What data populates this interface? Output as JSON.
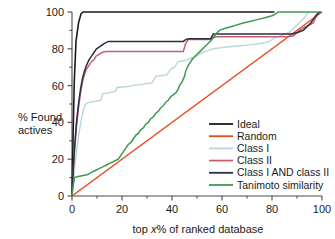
{
  "chart_data": {
    "type": "line",
    "title": "",
    "xlabel": "top x% of ranked database",
    "xlabel_prefix": "top ",
    "xlabel_italic": "x",
    "xlabel_suffix": "% of ranked database",
    "ylabel": "% Found actives",
    "ylabel_line1": "% Found",
    "ylabel_line2": "actives",
    "xlim": [
      0,
      100
    ],
    "ylim": [
      0,
      100
    ],
    "xticks": [
      0,
      20,
      40,
      60,
      80,
      100
    ],
    "yticks": [
      0,
      20,
      40,
      60,
      80,
      100
    ],
    "xtick_labels": [
      "0",
      "20",
      "40",
      "60",
      "80",
      "100"
    ],
    "ytick_labels": [
      "0",
      "20",
      "40",
      "60",
      "80",
      "100"
    ],
    "xminor_ticks": [
      10,
      30,
      50,
      70,
      90
    ],
    "yminor_ticks": [
      10,
      30,
      50,
      70,
      90
    ],
    "grid": false,
    "legend_position": "lower right",
    "series": [
      {
        "name": "Ideal",
        "color": "#1b1b1b",
        "width": 1.6,
        "points": [
          [
            0,
            0
          ],
          [
            0.4,
            30
          ],
          [
            0.9,
            62
          ],
          [
            1.6,
            84
          ],
          [
            2.6,
            94
          ],
          [
            3.6,
            99
          ],
          [
            4.4,
            100
          ],
          [
            81,
            100
          ]
        ]
      },
      {
        "name": "Random",
        "color": "#e8491d",
        "width": 1.5,
        "points": [
          [
            0,
            0
          ],
          [
            100,
            100
          ]
        ]
      },
      {
        "name": "Class I",
        "color": "#b9d6dc",
        "width": 1.4,
        "points": [
          [
            0,
            0
          ],
          [
            0.6,
            8
          ],
          [
            1.3,
            18
          ],
          [
            2.2,
            28
          ],
          [
            3.0,
            36
          ],
          [
            3.8,
            42
          ],
          [
            4.6,
            47
          ],
          [
            5.6,
            50
          ],
          [
            7.0,
            51
          ],
          [
            9.5,
            51.5
          ],
          [
            11.5,
            52
          ],
          [
            12.3,
            55.5
          ],
          [
            14.5,
            56
          ],
          [
            17.5,
            57
          ],
          [
            18.0,
            59
          ],
          [
            22.5,
            59.5
          ],
          [
            24.0,
            60
          ],
          [
            27.0,
            60.5
          ],
          [
            29.5,
            61
          ],
          [
            32.0,
            61.5
          ],
          [
            33.5,
            65
          ],
          [
            36.5,
            65.5
          ],
          [
            38.0,
            66
          ],
          [
            39.5,
            69
          ],
          [
            41.0,
            70
          ],
          [
            42.5,
            73
          ],
          [
            44.5,
            73.5
          ],
          [
            46.0,
            74
          ],
          [
            48.0,
            75
          ],
          [
            50.0,
            76
          ],
          [
            52.0,
            78
          ],
          [
            54.5,
            79
          ],
          [
            56.5,
            80
          ],
          [
            59.0,
            80.5
          ],
          [
            62.0,
            81
          ],
          [
            66.0,
            81.5
          ],
          [
            70.0,
            82
          ],
          [
            73.0,
            82.5
          ],
          [
            76.0,
            83
          ],
          [
            79.0,
            84
          ],
          [
            81.0,
            86
          ],
          [
            83.5,
            87
          ],
          [
            85.5,
            88
          ],
          [
            87.0,
            89
          ],
          [
            88.5,
            91
          ],
          [
            90.0,
            93
          ],
          [
            91.5,
            95
          ],
          [
            93.0,
            97
          ],
          [
            94.0,
            99
          ],
          [
            94.6,
            100
          ]
        ]
      },
      {
        "name": "Class II",
        "color": "#c4606a",
        "width": 1.5,
        "points": [
          [
            0,
            0
          ],
          [
            0.5,
            14
          ],
          [
            1.1,
            26
          ],
          [
            1.8,
            38
          ],
          [
            2.6,
            48
          ],
          [
            3.4,
            56
          ],
          [
            4.2,
            62
          ],
          [
            5.0,
            66
          ],
          [
            5.8,
            69
          ],
          [
            6.8,
            71
          ],
          [
            7.8,
            73
          ],
          [
            8.8,
            74
          ],
          [
            9.6,
            76
          ],
          [
            10.8,
            77
          ],
          [
            12.0,
            78
          ],
          [
            13.6,
            78.5
          ],
          [
            44.5,
            78.5
          ],
          [
            45.5,
            83
          ],
          [
            46.5,
            85
          ],
          [
            55.5,
            85
          ],
          [
            56.5,
            86
          ],
          [
            57.5,
            86.5
          ],
          [
            86.0,
            86.5
          ],
          [
            88.5,
            87
          ],
          [
            91.0,
            90
          ],
          [
            93.5,
            92
          ],
          [
            95.0,
            93
          ],
          [
            96.5,
            94
          ],
          [
            97.5,
            97
          ],
          [
            98.5,
            99
          ],
          [
            99.3,
            100
          ]
        ]
      },
      {
        "name": "Class I AND class II",
        "color": "#2d2d4a",
        "width": 1.5,
        "points": [
          [
            0,
            0
          ],
          [
            0.5,
            15
          ],
          [
            1.1,
            28
          ],
          [
            1.8,
            40
          ],
          [
            2.6,
            50
          ],
          [
            3.4,
            58
          ],
          [
            4.2,
            64
          ],
          [
            5.0,
            68
          ],
          [
            5.8,
            71
          ],
          [
            6.8,
            74
          ],
          [
            7.8,
            76
          ],
          [
            8.8,
            78
          ],
          [
            9.8,
            80
          ],
          [
            11.0,
            81
          ],
          [
            12.0,
            82
          ],
          [
            13.0,
            83
          ],
          [
            14.5,
            84
          ],
          [
            44.5,
            84
          ],
          [
            45.5,
            85
          ],
          [
            46.5,
            85.5
          ],
          [
            55.5,
            85.5
          ],
          [
            56.5,
            88
          ],
          [
            88.0,
            88
          ],
          [
            90.5,
            89
          ],
          [
            92.5,
            90
          ],
          [
            94.0,
            92
          ],
          [
            95.5,
            94
          ],
          [
            96.5,
            96
          ],
          [
            97.5,
            98
          ],
          [
            98.5,
            99.5
          ],
          [
            99.3,
            100
          ]
        ]
      },
      {
        "name": "Tanimoto similarity",
        "color": "#3f9a4e",
        "width": 1.5,
        "points": [
          [
            0,
            0
          ],
          [
            0.5,
            6
          ],
          [
            1.0,
            10
          ],
          [
            2.0,
            10.5
          ],
          [
            4.0,
            11
          ],
          [
            6.0,
            11.5
          ],
          [
            8.0,
            13
          ],
          [
            9.5,
            14
          ],
          [
            11.0,
            15
          ],
          [
            12.5,
            16
          ],
          [
            14.0,
            17
          ],
          [
            15.5,
            18
          ],
          [
            17.0,
            19
          ],
          [
            18.5,
            20
          ],
          [
            19.5,
            22
          ],
          [
            20.5,
            24
          ],
          [
            21.5,
            26
          ],
          [
            22.5,
            28
          ],
          [
            23.5,
            29
          ],
          [
            24.5,
            31
          ],
          [
            25.5,
            33
          ],
          [
            26.5,
            34
          ],
          [
            27.5,
            36
          ],
          [
            28.5,
            37
          ],
          [
            29.5,
            39
          ],
          [
            30.5,
            40
          ],
          [
            31.5,
            42
          ],
          [
            32.5,
            43
          ],
          [
            33.5,
            45
          ],
          [
            34.5,
            46
          ],
          [
            35.5,
            48
          ],
          [
            36.5,
            49
          ],
          [
            37.5,
            51
          ],
          [
            38.5,
            52
          ],
          [
            39.5,
            54
          ],
          [
            40.5,
            55
          ],
          [
            41.5,
            56
          ],
          [
            42.5,
            58
          ],
          [
            43.0,
            60
          ],
          [
            44.0,
            62
          ],
          [
            45.0,
            65
          ],
          [
            45.5,
            68
          ],
          [
            46.5,
            71
          ],
          [
            47.5,
            73
          ],
          [
            48.5,
            75
          ],
          [
            50.0,
            77
          ],
          [
            51.5,
            79
          ],
          [
            53.0,
            81
          ],
          [
            54.5,
            83
          ],
          [
            56.0,
            85
          ],
          [
            57.5,
            88
          ],
          [
            59.0,
            90
          ],
          [
            61.0,
            91
          ],
          [
            63.5,
            92
          ],
          [
            66.0,
            93
          ],
          [
            68.5,
            94
          ],
          [
            71.5,
            95
          ],
          [
            74.5,
            96
          ],
          [
            77.5,
            97
          ],
          [
            80.0,
            98
          ],
          [
            81.5,
            99
          ],
          [
            82.5,
            100
          ],
          [
            100,
            100
          ]
        ]
      }
    ]
  },
  "legend": {
    "entries": [
      {
        "label": "Ideal",
        "color": "#1b1b1b"
      },
      {
        "label": "Random",
        "color": "#e8491d"
      },
      {
        "label": "Class I",
        "color": "#b9d6dc"
      },
      {
        "label": "Class II",
        "color": "#c4606a"
      },
      {
        "label": "Class I AND class II",
        "color": "#2d2d4a"
      },
      {
        "label": "Tanimoto similarity",
        "color": "#3f9a4e"
      }
    ]
  },
  "colors": {
    "ideal": "#1b1b1b",
    "random": "#e8491d",
    "class_i": "#b9d6dc",
    "class_ii": "#c4606a",
    "class_i_and_ii": "#2d2d4a",
    "tanimoto": "#3f9a4e",
    "axis": "#4a4a4a",
    "text": "#1a1a1a",
    "background": "#ffffff"
  }
}
